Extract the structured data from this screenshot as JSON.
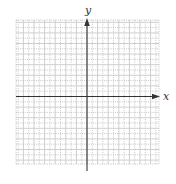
{
  "diagram": {
    "type": "coordinate-plane",
    "x_axis_label": "x",
    "y_axis_label": "y",
    "grid": {
      "left": 16,
      "right": 159,
      "top": 20,
      "bottom": 164,
      "origin_x": 87,
      "origin_y": 96.5,
      "minor_step": 5.3,
      "major_every": 2,
      "minor_color": "#b8b8b8",
      "major_color": "#cfcfcf"
    },
    "axis_color": "#333333",
    "x_axis": {
      "x1": 16,
      "x2": 160,
      "y": 96.5,
      "arrow": "positive"
    },
    "y_axis": {
      "x": 87,
      "y1": 18,
      "y2": 171,
      "arrow": "positive"
    }
  }
}
